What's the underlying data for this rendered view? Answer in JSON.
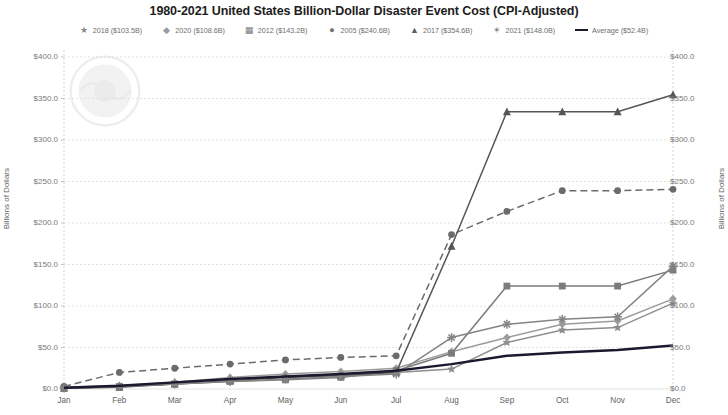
{
  "chart": {
    "title": "1980-2021 United States Billion-Dollar Disaster Event Cost (CPI-Adjusted)",
    "ylabel_left": "Billions of Dollars",
    "ylabel_right": "Billions of Dollars"
  },
  "legend": [
    {
      "label": "2018 ($103.5B)",
      "marker": "star-marker",
      "glyph": "★",
      "color": "#8a8a8a"
    },
    {
      "label": "2020 ($108.6B)",
      "marker": "diamond-marker",
      "glyph": "◆",
      "color": "#9a9a9a"
    },
    {
      "label": "2012 ($143.2B)",
      "marker": "square-marker",
      "glyph": "▦",
      "color": "#7d7d7d"
    },
    {
      "label": "2005 ($240.6B)",
      "marker": "circle-marker",
      "glyph": "●",
      "color": "#6f6f6f"
    },
    {
      "label": "2017 ($354.6B)",
      "marker": "triangle-marker",
      "glyph": "▲",
      "color": "#5c5c5c"
    },
    {
      "label": "2021 ($148.0B)",
      "marker": "asterisk-marker",
      "glyph": "✶",
      "color": "#808080"
    },
    {
      "label": "Average ($52.4B)",
      "marker": "line-marker",
      "glyph": "—",
      "color": "#1a1a2e"
    }
  ],
  "chart_data": {
    "type": "line",
    "title": "1980-2021 United States Billion-Dollar Disaster Event Cost (CPI-Adjusted)",
    "xlabel": "",
    "ylabel": "Billions of Dollars",
    "ylim": [
      0,
      400
    ],
    "yticks": [
      "$0.0",
      "$50.0",
      "$100.0",
      "$150.0",
      "$200.0",
      "$250.0",
      "$300.0",
      "$350.0",
      "$400.0"
    ],
    "ytick_values": [
      0,
      50,
      100,
      150,
      200,
      250,
      300,
      350,
      400
    ],
    "grid": true,
    "legend_position": "top",
    "categories": [
      "Jan",
      "Feb",
      "Mar",
      "Apr",
      "May",
      "Jun",
      "Jul",
      "Aug",
      "Sep",
      "Oct",
      "Nov",
      "Dec"
    ],
    "series": [
      {
        "name": "2018 ($103.5B)",
        "marker": "star",
        "dash": "solid",
        "color": "#8d8d8d",
        "values": [
          1.0,
          3.0,
          8.0,
          12.0,
          15.0,
          17.0,
          20.0,
          24.0,
          56.0,
          71.0,
          74.0,
          103.5
        ]
      },
      {
        "name": "2020 ($108.6B)",
        "marker": "diamond",
        "dash": "solid",
        "color": "#9c9c9c",
        "values": [
          2.0,
          4.0,
          8.0,
          14.0,
          18.0,
          21.0,
          25.0,
          45.0,
          62.0,
          78.0,
          82.0,
          108.6
        ]
      },
      {
        "name": "2012 ($143.2B)",
        "marker": "square",
        "dash": "solid",
        "color": "#7b7b7b",
        "values": [
          1.0,
          3.0,
          6.0,
          9.0,
          11.0,
          14.0,
          22.0,
          43.0,
          124.0,
          124.0,
          124.0,
          143.2
        ]
      },
      {
        "name": "2005 ($240.6B)",
        "marker": "circle",
        "dash": "dashed",
        "color": "#6b6b6b",
        "values": [
          3.0,
          20.0,
          25.0,
          30.0,
          35.0,
          38.0,
          40.0,
          186.0,
          214.0,
          239.0,
          239.0,
          240.6
        ]
      },
      {
        "name": "2017 ($354.6B)",
        "marker": "triangle",
        "dash": "solid",
        "color": "#555555",
        "values": [
          1.0,
          2.0,
          6.0,
          10.0,
          14.0,
          16.0,
          20.0,
          172.0,
          334.0,
          334.0,
          334.0,
          354.6
        ]
      },
      {
        "name": "2021 ($148.0B)",
        "marker": "asterisk",
        "dash": "solid",
        "color": "#858585",
        "values": [
          1.0,
          3.0,
          6.0,
          9.0,
          12.0,
          15.0,
          18.0,
          62.0,
          78.0,
          84.0,
          87.0,
          148.0
        ]
      },
      {
        "name": "Average ($52.4B)",
        "marker": "none",
        "dash": "solid",
        "color": "#191930",
        "values": [
          1.5,
          4.0,
          8.0,
          12.0,
          15.0,
          18.0,
          22.0,
          30.0,
          40.0,
          44.0,
          47.0,
          52.4
        ]
      }
    ]
  }
}
